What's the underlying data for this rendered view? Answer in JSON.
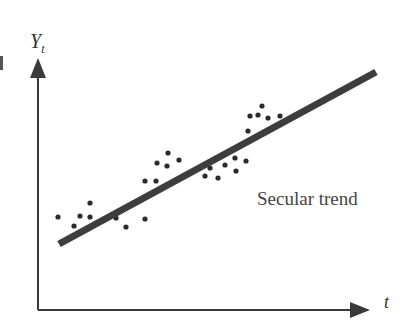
{
  "chart_data": {
    "type": "scatter",
    "title": "",
    "xlabel": "t",
    "ylabel_main": "Y",
    "ylabel_sub": "t",
    "annotation": "Secular trend",
    "grid": false,
    "legend": null,
    "axis_ranges_px": {
      "x": [
        38,
        395
      ],
      "y": [
        310,
        45
      ]
    },
    "trend_line": {
      "label": "Secular trend",
      "start": [
        59,
        244
      ],
      "end": [
        376,
        72
      ],
      "color": "#3d3d3d",
      "width": 7
    },
    "points": [
      [
        58,
        217
      ],
      [
        74,
        226
      ],
      [
        80,
        216
      ],
      [
        90,
        203
      ],
      [
        90,
        217
      ],
      [
        116,
        218
      ],
      [
        126,
        227
      ],
      [
        145,
        219
      ],
      [
        145,
        181
      ],
      [
        156,
        181
      ],
      [
        157,
        163
      ],
      [
        167,
        166
      ],
      [
        168,
        153
      ],
      [
        179,
        160
      ],
      [
        205,
        176
      ],
      [
        210,
        168
      ],
      [
        218,
        178
      ],
      [
        225,
        165
      ],
      [
        235,
        158
      ],
      [
        236,
        171
      ],
      [
        246,
        161
      ],
      [
        248,
        131
      ],
      [
        250,
        116
      ],
      [
        258,
        115
      ],
      [
        262,
        106
      ],
      [
        268,
        118
      ],
      [
        280,
        116
      ]
    ],
    "point_color": "#2b2b2b",
    "axis_color": "#3a3a3a"
  }
}
